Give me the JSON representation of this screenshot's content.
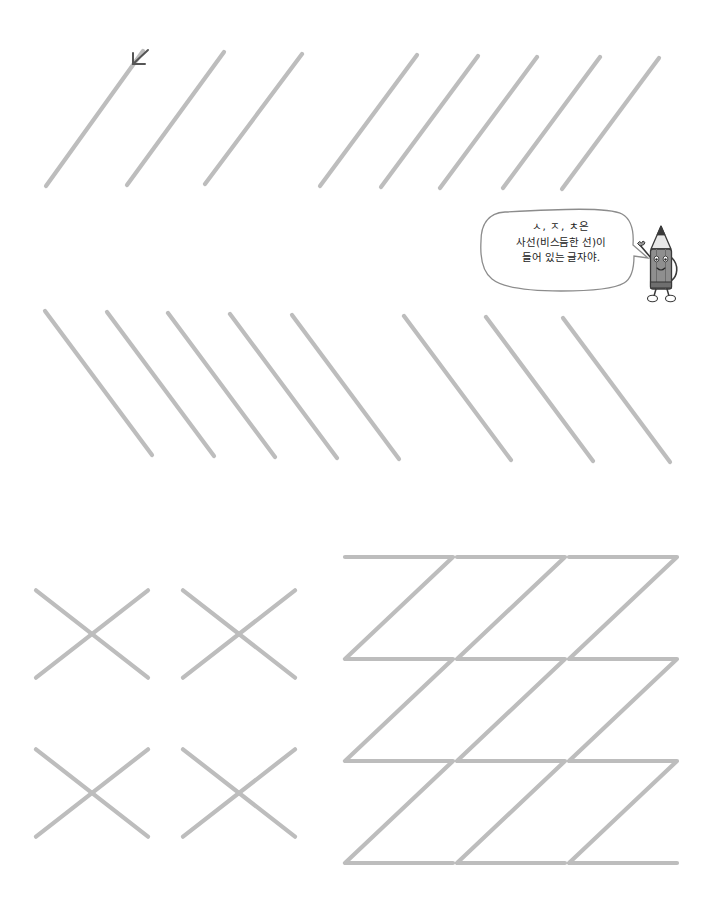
{
  "page": {
    "background_color": "#ffffff",
    "width": 709,
    "height": 918
  },
  "colors": {
    "guide_stroke": "#bdbdbd",
    "guide_stroke_light": "#c6c6c6",
    "arrow_marker": "#555555",
    "bubble_outline": "#8c8c8c",
    "bubble_fill": "#ffffff",
    "text": "#1b1b1b",
    "pencil_body": "#8a8a8a",
    "pencil_dark": "#6a6a6a",
    "pencil_outline": "#333333"
  },
  "speech_bubble": {
    "name": "pencil-speech-bubble",
    "line1": "ㅅ, ㅈ, ㅊ은",
    "line2": "사선(비스듬한 선)이",
    "line3": "들어 있는 글자야."
  },
  "mascot": {
    "name": "pencil-mascot",
    "label": "연필 캐릭터"
  },
  "stroke_arrow": {
    "name": "stroke-direction-arrow",
    "direction": "down-left"
  },
  "chart_data": {
    "type": "line",
    "xlabel": "",
    "ylabel": "",
    "grid": false,
    "legend": null,
    "rows": [
      {
        "name": "row-1-forward-diagonals",
        "direction": "bottom-left-to-top-right",
        "count": 8,
        "note": "3 wide-spaced strokes then 5 closer strokes",
        "lines": [
          {
            "x1": 46,
            "y1": 186,
            "x2": 143,
            "y2": 51
          },
          {
            "x1": 127,
            "y1": 185,
            "x2": 224,
            "y2": 52
          },
          {
            "x1": 205,
            "y1": 184,
            "x2": 302,
            "y2": 54
          },
          {
            "x1": 320,
            "y1": 186,
            "x2": 417,
            "y2": 55
          },
          {
            "x1": 381,
            "y1": 187,
            "x2": 478,
            "y2": 56
          },
          {
            "x1": 440,
            "y1": 188,
            "x2": 537,
            "y2": 57
          },
          {
            "x1": 503,
            "y1": 188,
            "x2": 600,
            "y2": 57
          },
          {
            "x1": 562,
            "y1": 189,
            "x2": 659,
            "y2": 58
          }
        ]
      },
      {
        "name": "row-2-back-diagonals",
        "direction": "top-left-to-bottom-right",
        "count": 8,
        "note": "5 closer strokes then 3 spaced strokes",
        "lines": [
          {
            "x1": 45,
            "y1": 311,
            "x2": 152,
            "y2": 455
          },
          {
            "x1": 107,
            "y1": 312,
            "x2": 214,
            "y2": 456
          },
          {
            "x1": 168,
            "y1": 313,
            "x2": 275,
            "y2": 457
          },
          {
            "x1": 230,
            "y1": 314,
            "x2": 337,
            "y2": 458
          },
          {
            "x1": 292,
            "y1": 315,
            "x2": 399,
            "y2": 459
          },
          {
            "x1": 404,
            "y1": 316,
            "x2": 511,
            "y2": 460
          },
          {
            "x1": 486,
            "y1": 317,
            "x2": 593,
            "y2": 461
          },
          {
            "x1": 563,
            "y1": 318,
            "x2": 670,
            "y2": 462
          }
        ]
      },
      {
        "name": "x-shapes-grid",
        "shape": "X",
        "rows": 2,
        "cols": 2,
        "items": [
          {
            "cx": 92,
            "cy": 634,
            "half": 56
          },
          {
            "cx": 239,
            "cy": 634,
            "half": 56
          },
          {
            "cx": 92,
            "cy": 793,
            "half": 56
          },
          {
            "cx": 239,
            "cy": 793,
            "half": 56
          }
        ]
      },
      {
        "name": "zigzag-columns",
        "shape": "zigzag-Z",
        "count": 3,
        "segments_per_column": 3,
        "columns": [
          {
            "left": 345,
            "top": 557,
            "width": 108,
            "seg_h": 102
          },
          {
            "left": 457,
            "top": 557,
            "width": 108,
            "seg_h": 102
          },
          {
            "left": 569,
            "top": 557,
            "width": 108,
            "seg_h": 102
          }
        ]
      }
    ]
  }
}
